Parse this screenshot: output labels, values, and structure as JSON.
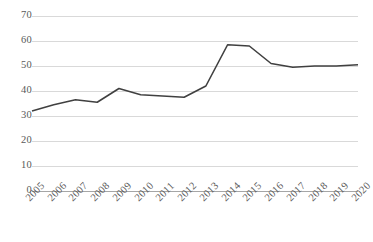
{
  "chart_data": {
    "type": "line",
    "title": "",
    "subtitle": "",
    "xlabel": "",
    "ylabel": "",
    "categories": [
      "2005",
      "2006",
      "2007",
      "2008",
      "2009",
      "2010",
      "2011",
      "2012",
      "2013",
      "2014",
      "2015",
      "2016",
      "2017",
      "2018",
      "2019",
      "2020"
    ],
    "values": [
      32,
      34.5,
      36.5,
      35.5,
      41,
      38.5,
      38,
      37.5,
      42,
      58.5,
      58,
      51,
      49.5,
      50,
      50,
      50.5
    ],
    "series": [
      {
        "name": "",
        "values": [
          32,
          34.5,
          36.5,
          35.5,
          41,
          38.5,
          38,
          37.5,
          42,
          58.5,
          58,
          51,
          49.5,
          50,
          50,
          50.5
        ]
      }
    ],
    "ylim": [
      0,
      70
    ],
    "ytick_values": [
      0,
      10,
      20,
      30,
      40,
      50,
      60,
      70
    ],
    "ytick_labels": [
      "0",
      "10",
      "20",
      "30",
      "40",
      "50",
      "60",
      "70"
    ],
    "xtick_labels": [
      "2005",
      "2006",
      "2007",
      "2008",
      "2009",
      "2010",
      "2011",
      "2012",
      "2013",
      "2014",
      "2015",
      "2016",
      "2017",
      "2018",
      "2019",
      "2020"
    ],
    "grid": true,
    "grid_axis": "y",
    "legend": false,
    "legend_position": "none",
    "annotations": [],
    "markers": false
  },
  "style": {
    "line_color": "#404040",
    "grid_color": "#d9d9d9",
    "axis_color": "#a6a6a6",
    "tick_text_color": "#595959",
    "background": "#ffffff",
    "line_width": 1.6
  },
  "axes": {
    "plot_left": 32,
    "plot_right": 358,
    "plot_top": 16,
    "plot_bottom": 191
  }
}
